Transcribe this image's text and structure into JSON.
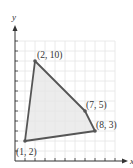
{
  "chart_data": {
    "type": "scatter",
    "title": "",
    "xlabel": "x",
    "ylabel": "y",
    "xlim": [
      0,
      10
    ],
    "ylim": [
      0,
      12
    ],
    "grid": true,
    "shape": "polygon",
    "points": [
      {
        "x": 1,
        "y": 2,
        "label": "(1, 2)"
      },
      {
        "x": 2,
        "y": 10,
        "label": "(2, 10)"
      },
      {
        "x": 7,
        "y": 5,
        "label": "(7, 5)"
      },
      {
        "x": 8,
        "y": 3,
        "label": "(8, 3)"
      }
    ]
  },
  "colors": {
    "fill": "#e6e6e6",
    "edge": "#555555",
    "grid": "#e4e4e4",
    "axis": "#333333"
  }
}
